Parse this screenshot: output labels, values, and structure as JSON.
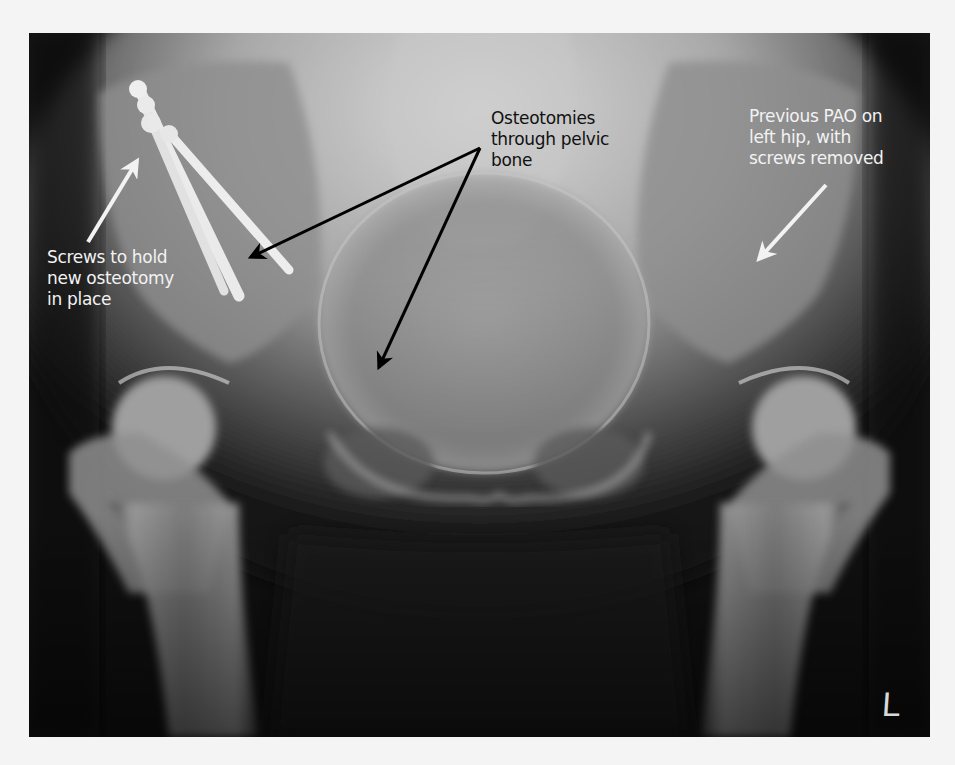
{
  "figure": {
    "type": "pelvic-radiograph",
    "view": "AP pelvis",
    "side_marker": "L"
  },
  "annotations": [
    {
      "id": "screws",
      "text": "Screws to hold\nnew osteotomy\nin place",
      "color": "#f2f2f2"
    },
    {
      "id": "osteotomies",
      "text": "Osteotomies\nthrough pelvic\nbone",
      "color": "#111111"
    },
    {
      "id": "previous-pao",
      "text": "Previous PAO on\nleft hip, with\nscrews removed",
      "color": "#f2f2f2"
    }
  ],
  "colors": {
    "page_background": "#f4f4f4",
    "film_background": "#0c0c0c",
    "bone": "#bdbdbd",
    "hardware": "#f5f5f5"
  }
}
